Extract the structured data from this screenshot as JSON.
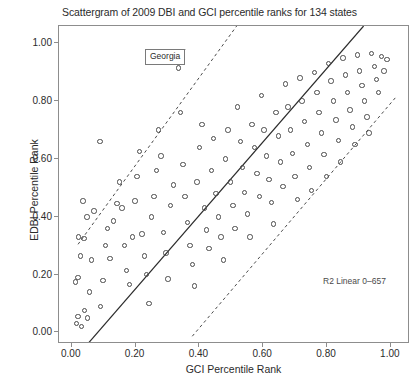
{
  "chart_data": {
    "type": "scatter",
    "title": "Scattergram of 2009 DBI and GCI percentile ranks for 134 states",
    "xlabel": "GCI Percentile Rank",
    "ylabel": "EDBI Percentile Rank",
    "xlim": [
      -0.04,
      1.06
    ],
    "ylim": [
      -0.04,
      1.06
    ],
    "grid": false,
    "legend": null,
    "xticks": [
      "0.00",
      "0.20",
      "0.40",
      "0.60",
      "0.80",
      "1.00"
    ],
    "xtick_values": [
      0.0,
      0.2,
      0.4,
      0.6,
      0.8,
      1.0
    ],
    "yticks": [
      "0.00",
      "0.20",
      "0.40",
      "0.60",
      "0.80",
      "1.00"
    ],
    "ytick_values": [
      0.0,
      0.2,
      0.4,
      0.6,
      0.8,
      1.0
    ],
    "n_points": 134,
    "marker": "open-circle",
    "marker_color": "#4a4a4a",
    "fit_line": {
      "type": "linear-regression",
      "style": "solid",
      "color": "#2b2b2b",
      "x0": 0.04,
      "y0": -0.06,
      "x1": 0.92,
      "y1": 1.06
    },
    "reference_lines": [
      {
        "name": "upper-confidence-band",
        "style": "dashed",
        "color": "#4a4a4a",
        "x0": 0.02,
        "y0": 0.3,
        "x1": 0.52,
        "y1": 1.06
      },
      {
        "name": "lower-confidence-band",
        "style": "dashed",
        "color": "#4a4a4a",
        "x0": 0.38,
        "y0": -0.02,
        "x1": 1.02,
        "y1": 0.81
      }
    ],
    "annotations": [
      {
        "name": "georgia-label",
        "text": "Georgia",
        "x": 0.335,
        "y": 0.915,
        "label_x": 0.245,
        "label_y": 1.0
      },
      {
        "name": "r2-label",
        "text": "R2 Linear 0–657",
        "x": 0.78,
        "y": 0.215
      }
    ],
    "points": [
      [
        0.015,
        0.03
      ],
      [
        0.02,
        0.055
      ],
      [
        0.03,
        0.02
      ],
      [
        0.04,
        0.075
      ],
      [
        0.05,
        0.05
      ],
      [
        0.012,
        0.175
      ],
      [
        0.02,
        0.19
      ],
      [
        0.028,
        0.265
      ],
      [
        0.022,
        0.33
      ],
      [
        0.038,
        0.325
      ],
      [
        0.055,
        0.14
      ],
      [
        0.062,
        0.25
      ],
      [
        0.07,
        0.42
      ],
      [
        0.048,
        0.4
      ],
      [
        0.035,
        0.455
      ],
      [
        0.09,
        0.09
      ],
      [
        0.098,
        0.18
      ],
      [
        0.105,
        0.3
      ],
      [
        0.112,
        0.36
      ],
      [
        0.12,
        0.255
      ],
      [
        0.13,
        0.385
      ],
      [
        0.142,
        0.445
      ],
      [
        0.088,
        0.66
      ],
      [
        0.15,
        0.52
      ],
      [
        0.158,
        0.43
      ],
      [
        0.165,
        0.3
      ],
      [
        0.172,
        0.215
      ],
      [
        0.18,
        0.165
      ],
      [
        0.19,
        0.33
      ],
      [
        0.198,
        0.455
      ],
      [
        0.205,
        0.54
      ],
      [
        0.212,
        0.625
      ],
      [
        0.22,
        0.34
      ],
      [
        0.228,
        0.265
      ],
      [
        0.235,
        0.2
      ],
      [
        0.242,
        0.1
      ],
      [
        0.25,
        0.4
      ],
      [
        0.258,
        0.47
      ],
      [
        0.265,
        0.56
      ],
      [
        0.272,
        0.7
      ],
      [
        0.28,
        0.61
      ],
      [
        0.288,
        0.345
      ],
      [
        0.295,
        0.275
      ],
      [
        0.302,
        0.185
      ],
      [
        0.31,
        0.44
      ],
      [
        0.318,
        0.51
      ],
      [
        0.335,
        0.915
      ],
      [
        0.34,
        0.76
      ],
      [
        0.348,
        0.58
      ],
      [
        0.355,
        0.47
      ],
      [
        0.362,
        0.38
      ],
      [
        0.37,
        0.3
      ],
      [
        0.378,
        0.235
      ],
      [
        0.385,
        0.16
      ],
      [
        0.392,
        0.52
      ],
      [
        0.4,
        0.64
      ],
      [
        0.408,
        0.72
      ],
      [
        0.415,
        0.43
      ],
      [
        0.422,
        0.355
      ],
      [
        0.43,
        0.29
      ],
      [
        0.438,
        0.56
      ],
      [
        0.445,
        0.67
      ],
      [
        0.452,
        0.48
      ],
      [
        0.46,
        0.4
      ],
      [
        0.468,
        0.33
      ],
      [
        0.475,
        0.25
      ],
      [
        0.482,
        0.6
      ],
      [
        0.49,
        0.7
      ],
      [
        0.498,
        0.52
      ],
      [
        0.505,
        0.44
      ],
      [
        0.512,
        0.36
      ],
      [
        0.52,
        0.78
      ],
      [
        0.528,
        0.66
      ],
      [
        0.535,
        0.57
      ],
      [
        0.542,
        0.485
      ],
      [
        0.55,
        0.41
      ],
      [
        0.558,
        0.33
      ],
      [
        0.565,
        0.72
      ],
      [
        0.572,
        0.64
      ],
      [
        0.58,
        0.55
      ],
      [
        0.588,
        0.47
      ],
      [
        0.595,
        0.82
      ],
      [
        0.602,
        0.7
      ],
      [
        0.61,
        0.61
      ],
      [
        0.618,
        0.53
      ],
      [
        0.625,
        0.45
      ],
      [
        0.632,
        0.375
      ],
      [
        0.64,
        0.76
      ],
      [
        0.648,
        0.68
      ],
      [
        0.655,
        0.59
      ],
      [
        0.662,
        0.505
      ],
      [
        0.67,
        0.86
      ],
      [
        0.678,
        0.78
      ],
      [
        0.685,
        0.7
      ],
      [
        0.692,
        0.62
      ],
      [
        0.7,
        0.54
      ],
      [
        0.708,
        0.46
      ],
      [
        0.715,
        0.88
      ],
      [
        0.722,
        0.8
      ],
      [
        0.73,
        0.73
      ],
      [
        0.738,
        0.65
      ],
      [
        0.745,
        0.57
      ],
      [
        0.752,
        0.49
      ],
      [
        0.76,
        0.9
      ],
      [
        0.768,
        0.83
      ],
      [
        0.775,
        0.76
      ],
      [
        0.782,
        0.69
      ],
      [
        0.79,
        0.615
      ],
      [
        0.798,
        0.54
      ],
      [
        0.805,
        0.93
      ],
      [
        0.812,
        0.87
      ],
      [
        0.82,
        0.8
      ],
      [
        0.828,
        0.735
      ],
      [
        0.835,
        0.665
      ],
      [
        0.842,
        0.59
      ],
      [
        0.85,
        0.95
      ],
      [
        0.858,
        0.89
      ],
      [
        0.865,
        0.83
      ],
      [
        0.872,
        0.77
      ],
      [
        0.88,
        0.71
      ],
      [
        0.888,
        0.65
      ],
      [
        0.895,
        0.96
      ],
      [
        0.902,
        0.905
      ],
      [
        0.91,
        0.855
      ],
      [
        0.918,
        0.8
      ],
      [
        0.925,
        0.745
      ],
      [
        0.932,
        0.69
      ],
      [
        0.94,
        0.965
      ],
      [
        0.948,
        0.92
      ],
      [
        0.955,
        0.875
      ],
      [
        0.962,
        0.83
      ],
      [
        0.97,
        0.955
      ],
      [
        0.978,
        0.905
      ],
      [
        0.988,
        0.945
      ]
    ]
  }
}
